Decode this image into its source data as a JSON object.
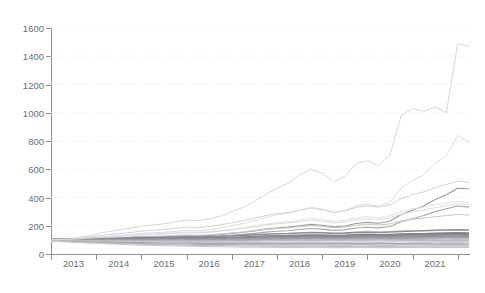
{
  "chart_data": {
    "type": "line",
    "title": "",
    "xlabel": "",
    "ylabel": "",
    "ylim": [
      0,
      1600
    ],
    "xlim": [
      2012.5,
      2021.75
    ],
    "grid": true,
    "legend": "none",
    "ytick_labels": [
      "0",
      "200",
      "400",
      "600",
      "800",
      "1000",
      "1200",
      "1400",
      "1600"
    ],
    "ytick_values": [
      0,
      200,
      400,
      600,
      800,
      1000,
      1200,
      1400,
      1600
    ],
    "xtick_labels": [
      "2013",
      "2014",
      "2015",
      "2016",
      "2017",
      "2018",
      "2019",
      "2020",
      "2021"
    ],
    "xtick_values": [
      2013,
      2014,
      2015,
      2016,
      2017,
      2018,
      2019,
      2020,
      2021
    ],
    "x": [
      2012.5,
      2012.75,
      2013.0,
      2013.25,
      2013.5,
      2013.75,
      2014.0,
      2014.25,
      2014.5,
      2014.75,
      2015.0,
      2015.25,
      2015.5,
      2015.75,
      2016.0,
      2016.25,
      2016.5,
      2016.75,
      2017.0,
      2017.25,
      2017.5,
      2017.75,
      2018.0,
      2018.25,
      2018.5,
      2018.75,
      2019.0,
      2019.25,
      2019.5,
      2019.75,
      2020.0,
      2020.25,
      2020.5,
      2020.75,
      2021.0,
      2021.25,
      2021.5,
      2021.75
    ],
    "series": [
      {
        "name": "series-01",
        "color": "#d8d8dc",
        "width": 1.0,
        "values": [
          100,
          104,
          112,
          124,
          140,
          158,
          170,
          182,
          196,
          206,
          214,
          228,
          240,
          236,
          248,
          268,
          300,
          330,
          372,
          420,
          468,
          500,
          560,
          600,
          572,
          512,
          548,
          640,
          660,
          626,
          700,
          980,
          1030,
          1010,
          1040,
          1000,
          1490,
          1470
        ]
      },
      {
        "name": "series-02",
        "color": "#dedee2",
        "width": 1.0,
        "values": [
          100,
          101,
          104,
          110,
          116,
          124,
          130,
          138,
          146,
          150,
          154,
          160,
          166,
          164,
          172,
          184,
          200,
          216,
          236,
          258,
          276,
          288,
          310,
          330,
          318,
          292,
          306,
          342,
          352,
          340,
          366,
          470,
          520,
          560,
          640,
          700,
          840,
          790
        ]
      },
      {
        "name": "series-03",
        "color": "#9a9a9f",
        "width": 1.1,
        "values": [
          100,
          100,
          102,
          104,
          107,
          110,
          112,
          116,
          120,
          122,
          124,
          128,
          130,
          128,
          132,
          138,
          146,
          154,
          164,
          176,
          184,
          190,
          200,
          210,
          204,
          192,
          198,
          216,
          224,
          218,
          232,
          280,
          310,
          340,
          386,
          420,
          466,
          462
        ]
      },
      {
        "name": "series-04",
        "color": "#a8a8ad",
        "width": 1.1,
        "values": [
          100,
          99,
          100,
          102,
          104,
          106,
          107,
          110,
          113,
          114,
          116,
          119,
          121,
          120,
          123,
          127,
          133,
          139,
          146,
          155,
          161,
          165,
          173,
          180,
          176,
          167,
          171,
          184,
          189,
          185,
          195,
          228,
          250,
          272,
          300,
          320,
          340,
          332
        ]
      },
      {
        "name": "series-05",
        "color": "#e2e2e6",
        "width": 1.0,
        "values": [
          100,
          102,
          106,
          112,
          118,
          124,
          128,
          134,
          140,
          143,
          146,
          151,
          155,
          153,
          158,
          166,
          176,
          186,
          198,
          212,
          222,
          228,
          240,
          252,
          245,
          231,
          238,
          257,
          264,
          258,
          270,
          300,
          318,
          330,
          348,
          360,
          372,
          364
        ]
      },
      {
        "name": "series-06",
        "color": "#c6c6cb",
        "width": 1.0,
        "values": [
          100,
          101,
          103,
          106,
          110,
          113,
          115,
          119,
          123,
          125,
          127,
          131,
          134,
          132,
          136,
          142,
          149,
          156,
          164,
          174,
          181,
          185,
          193,
          201,
          196,
          186,
          191,
          204,
          209,
          205,
          213,
          234,
          246,
          254,
          264,
          272,
          280,
          276
        ]
      },
      {
        "name": "series-07",
        "color": "#8c8c92",
        "width": 1.6,
        "values": [
          102,
          103,
          105,
          107,
          109,
          111,
          112,
          114,
          116,
          117,
          118,
          120,
          122,
          121,
          123,
          126,
          129,
          132,
          136,
          140,
          143,
          145,
          149,
          152,
          150,
          146,
          148,
          153,
          155,
          153,
          156,
          160,
          163,
          165,
          168,
          170,
          172,
          170
        ]
      },
      {
        "name": "series-08",
        "color": "#7e7e84",
        "width": 2.4,
        "values": [
          100,
          100,
          101,
          102,
          103,
          104,
          105,
          106,
          107,
          108,
          108,
          110,
          111,
          110,
          112,
          114,
          116,
          118,
          121,
          124,
          126,
          127,
          130,
          132,
          131,
          128,
          129,
          133,
          134,
          133,
          135,
          138,
          140,
          141,
          143,
          145,
          147,
          146
        ]
      },
      {
        "name": "series-09",
        "color": "#8a8a90",
        "width": 2.8,
        "values": [
          99,
          99,
          100,
          100,
          101,
          102,
          102,
          103,
          104,
          104,
          105,
          106,
          107,
          106,
          107,
          109,
          111,
          112,
          114,
          117,
          118,
          119,
          121,
          123,
          122,
          120,
          121,
          124,
          125,
          124,
          126,
          128,
          130,
          131,
          132,
          134,
          135,
          134
        ]
      },
      {
        "name": "series-10",
        "color": "#95959b",
        "width": 2.2,
        "values": [
          98,
          98,
          98,
          99,
          99,
          100,
          100,
          100,
          101,
          101,
          102,
          102,
          103,
          102,
          103,
          104,
          106,
          107,
          109,
          111,
          112,
          113,
          115,
          116,
          115,
          113,
          114,
          117,
          118,
          117,
          118,
          120,
          122,
          123,
          124,
          126,
          127,
          126
        ]
      },
      {
        "name": "series-11",
        "color": "#a0a0a6",
        "width": 1.8,
        "values": [
          97,
          97,
          97,
          97,
          97,
          98,
          98,
          98,
          98,
          98,
          99,
          99,
          99,
          98,
          99,
          100,
          101,
          102,
          103,
          105,
          106,
          106,
          108,
          109,
          108,
          107,
          107,
          109,
          110,
          109,
          110,
          112,
          113,
          114,
          115,
          116,
          117,
          116
        ]
      },
      {
        "name": "series-12",
        "color": "#b4b4b9",
        "width": 1.3,
        "values": [
          96,
          96,
          95,
          95,
          95,
          95,
          95,
          95,
          95,
          95,
          95,
          95,
          95,
          94,
          95,
          95,
          96,
          96,
          97,
          98,
          99,
          99,
          100,
          101,
          100,
          99,
          99,
          101,
          101,
          100,
          101,
          102,
          103,
          104,
          105,
          106,
          107,
          106
        ]
      },
      {
        "name": "series-13",
        "color": "#bdbdc2",
        "width": 1.2,
        "values": [
          95,
          94,
          93,
          92,
          92,
          91,
          91,
          91,
          90,
          90,
          90,
          90,
          90,
          89,
          89,
          90,
          90,
          90,
          91,
          92,
          92,
          92,
          93,
          94,
          93,
          92,
          92,
          93,
          93,
          92,
          93,
          94,
          95,
          95,
          96,
          97,
          98,
          97
        ]
      },
      {
        "name": "series-14",
        "color": "#c9c9ce",
        "width": 1.2,
        "values": [
          94,
          93,
          91,
          90,
          89,
          88,
          87,
          86,
          85,
          85,
          84,
          84,
          83,
          82,
          82,
          82,
          82,
          82,
          83,
          83,
          84,
          84,
          84,
          85,
          84,
          83,
          83,
          84,
          84,
          83,
          84,
          85,
          85,
          86,
          87,
          88,
          88,
          87
        ]
      },
      {
        "name": "series-15",
        "color": "#a4a4aa",
        "width": 1.2,
        "values": [
          93,
          91,
          89,
          87,
          85,
          84,
          83,
          81,
          80,
          79,
          78,
          77,
          76,
          75,
          74,
          74,
          74,
          74,
          74,
          74,
          74,
          74,
          75,
          75,
          74,
          73,
          73,
          74,
          74,
          73,
          74,
          74,
          75,
          75,
          76,
          77,
          77,
          76
        ]
      },
      {
        "name": "series-16",
        "color": "#b0b0b6",
        "width": 1.2,
        "values": [
          92,
          90,
          87,
          84,
          82,
          80,
          78,
          76,
          74,
          73,
          72,
          70,
          69,
          68,
          67,
          66,
          66,
          65,
          65,
          65,
          65,
          65,
          65,
          65,
          64,
          63,
          63,
          64,
          64,
          63,
          63,
          64,
          64,
          65,
          65,
          66,
          66,
          65
        ]
      },
      {
        "name": "series-17",
        "color": "#bbbbc0",
        "width": 1.1,
        "values": [
          91,
          88,
          85,
          82,
          79,
          76,
          74,
          71,
          69,
          67,
          66,
          64,
          62,
          61,
          60,
          59,
          58,
          57,
          57,
          56,
          56,
          56,
          56,
          56,
          55,
          54,
          54,
          55,
          55,
          54,
          54,
          55,
          55,
          55,
          56,
          56,
          57,
          56
        ]
      },
      {
        "name": "series-18",
        "color": "#cacace",
        "width": 1.1,
        "values": [
          90,
          87,
          83,
          79,
          76,
          72,
          69,
          66,
          63,
          61,
          59,
          57,
          55,
          53,
          52,
          51,
          50,
          49,
          48,
          48,
          47,
          47,
          47,
          47,
          46,
          45,
          45,
          46,
          46,
          45,
          45,
          46,
          46,
          46,
          47,
          47,
          48,
          47
        ]
      },
      {
        "name": "series-19",
        "color": "#d2d2d7",
        "width": 1.0,
        "values": [
          100,
          103,
          108,
          116,
          126,
          136,
          144,
          152,
          162,
          168,
          174,
          182,
          190,
          187,
          194,
          206,
          222,
          236,
          254,
          272,
          286,
          294,
          310,
          324,
          314,
          296,
          304,
          330,
          340,
          332,
          348,
          392,
          420,
          440,
          470,
          492,
          516,
          508
        ]
      },
      {
        "name": "series-20",
        "color": "#dcdce0",
        "width": 1.0,
        "values": [
          100,
          102,
          105,
          110,
          115,
          120,
          124,
          129,
          135,
          138,
          141,
          146,
          151,
          149,
          153,
          161,
          171,
          181,
          193,
          205,
          214,
          220,
          230,
          240,
          233,
          221,
          226,
          243,
          250,
          245,
          255,
          282,
          298,
          310,
          328,
          342,
          356,
          350
        ]
      }
    ]
  },
  "title_strip": {
    "text": "·· ······ ··· ············"
  }
}
